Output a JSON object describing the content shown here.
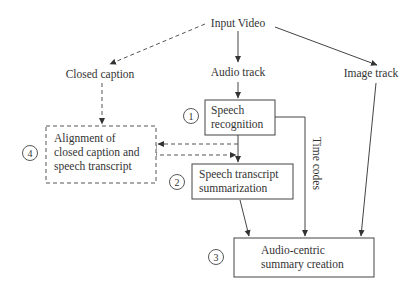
{
  "diagram": {
    "nodes": {
      "input_video": "Input Video",
      "closed_caption": "Closed caption",
      "audio_track": "Audio track",
      "image_track": "Image track",
      "speech_recognition": [
        "Speech",
        "recognition"
      ],
      "alignment": [
        "Alignment of",
        "closed caption and",
        "speech transcript"
      ],
      "summarization": [
        "Speech transcript",
        "summarization"
      ],
      "summary_creation": [
        "Audio-centric",
        "summary creation"
      ]
    },
    "edge_labels": {
      "time_codes": "Time codes"
    },
    "step_numbers": {
      "speech_recognition": "1",
      "summarization": "2",
      "summary_creation": "3",
      "alignment": "4"
    },
    "colors": {
      "stroke": "#444444",
      "text": "#333333",
      "background": "#ffffff"
    }
  }
}
